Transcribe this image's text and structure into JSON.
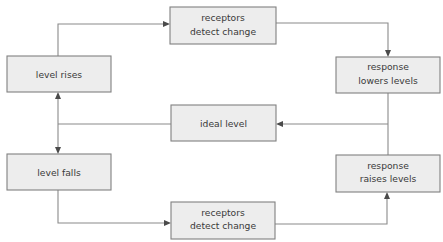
{
  "diagram": {
    "background_color": "#ffffff",
    "node_fill": "#ededed",
    "node_border": "#808080",
    "line_color": "#8a8a8a",
    "text_color": "#3a3a3a",
    "nodes": [
      {
        "id": "receptors-top",
        "line1": "receptors",
        "line2": "detect change",
        "x": 170,
        "y": 7,
        "w": 106,
        "h": 37
      },
      {
        "id": "level-rises",
        "line1": "level rises",
        "line2": "",
        "x": 7,
        "y": 56,
        "w": 104,
        "h": 36
      },
      {
        "id": "response-lowers",
        "line1": "response",
        "line2": "lowers levels",
        "x": 336,
        "y": 57,
        "w": 104,
        "h": 36
      },
      {
        "id": "ideal-level",
        "line1": "ideal level",
        "line2": "",
        "x": 171,
        "y": 105,
        "w": 105,
        "h": 36
      },
      {
        "id": "level-falls",
        "line1": "level falls",
        "line2": "",
        "x": 7,
        "y": 154,
        "w": 104,
        "h": 36
      },
      {
        "id": "response-raises",
        "line1": "response",
        "line2": "raises levels",
        "x": 336,
        "y": 155,
        "w": 104,
        "h": 37
      },
      {
        "id": "receptors-bottom",
        "line1": "receptors",
        "line2": "detect change",
        "x": 171,
        "y": 202,
        "w": 104,
        "h": 37
      }
    ],
    "connections": [
      {
        "id": "level-rises-to-receptors-top",
        "from": "level-rises",
        "to": "receptors-top"
      },
      {
        "id": "receptors-top-to-response-lowers",
        "from": "receptors-top",
        "to": "response-lowers"
      },
      {
        "id": "response-lowers-to-ideal-level",
        "from": "response-lowers",
        "to": "ideal-level"
      },
      {
        "id": "ideal-level-to-level-rises-falls",
        "from": "ideal-level",
        "to": "level-rises / level-falls"
      },
      {
        "id": "level-falls-to-receptors-bottom",
        "from": "level-falls",
        "to": "receptors-bottom"
      },
      {
        "id": "receptors-bottom-to-response-raises",
        "from": "receptors-bottom",
        "to": "response-raises"
      },
      {
        "id": "response-raises-to-response-lowers-spine",
        "from": "response-raises",
        "to": "response-lowers"
      }
    ]
  }
}
